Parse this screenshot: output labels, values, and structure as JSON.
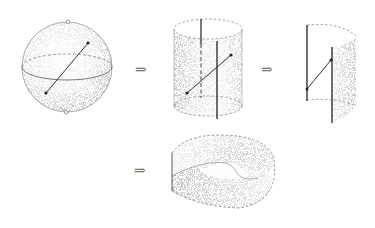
{
  "figure": {
    "stages": [
      {
        "name": "sphere",
        "label": "sphere with a chord joining two marked points"
      },
      {
        "name": "cylinder",
        "label": "cylinder with seam lines"
      },
      {
        "name": "cut-cylinder",
        "label": "cylinder cut open along a line"
      },
      {
        "name": "mobius-strip",
        "label": "Möbius strip"
      }
    ],
    "arrows": [
      "⇒",
      "⇒",
      "⇒"
    ],
    "colors": {
      "ink": "#333333",
      "stipple": "#555555",
      "background": "#ffffff"
    }
  }
}
